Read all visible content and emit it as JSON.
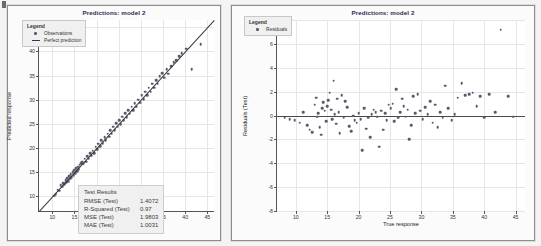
{
  "page": {
    "background_color": "#f4f4f4",
    "marker_color": "#5a5a6e",
    "line_color": "#3a3a3a"
  },
  "left_panel": {
    "legend": {
      "title": "Legend",
      "entries": [
        {
          "label": "Observations",
          "symbol": "dot"
        },
        {
          "label": "Perfect prediction",
          "symbol": "line"
        }
      ]
    },
    "results": {
      "title": "Test Results",
      "rows": [
        {
          "key": "RMSE (Test)",
          "value": "1.4072"
        },
        {
          "key": "R-Squared (Test)",
          "value": "0.97"
        },
        {
          "key": "MSE (Test)",
          "value": "1.9803"
        },
        {
          "key": "MAE (Test)",
          "value": "1.0031"
        }
      ]
    }
  },
  "right_panel": {
    "legend": {
      "title": "Legend",
      "entries": [
        {
          "label": "Residuals",
          "symbol": "dot"
        }
      ]
    }
  },
  "chart_data": [
    {
      "type": "scatter",
      "title": "Predictions: model 2",
      "xlabel": "True response",
      "ylabel": "Predicted response",
      "xlim": [
        7,
        46.5
      ],
      "ylim": [
        7,
        46.5
      ],
      "xticks": [
        10,
        15,
        20,
        25,
        30,
        35,
        40,
        45
      ],
      "yticks": [
        10,
        15,
        20,
        25,
        30,
        35,
        40,
        45
      ],
      "grid": true,
      "legend_position": "top-left",
      "series": [
        {
          "name": "Observations",
          "marker": "dot",
          "x": [
            10.4,
            10.8,
            11.2,
            11.5,
            11.9,
            12.2,
            12.4,
            12.7,
            13.0,
            13.2,
            13.4,
            13.6,
            13.8,
            14.0,
            14.2,
            14.4,
            14.6,
            14.8,
            15.0,
            15.2,
            15.4,
            15.6,
            15.8,
            16.0,
            16.2,
            16.5,
            16.8,
            17.0,
            17.3,
            17.6,
            17.9,
            18.2,
            18.5,
            18.8,
            19.1,
            19.4,
            19.8,
            20.1,
            20.4,
            20.8,
            21.1,
            21.4,
            21.8,
            22.1,
            22.5,
            22.8,
            23.1,
            23.4,
            23.8,
            24.1,
            24.4,
            24.8,
            25.1,
            25.4,
            25.8,
            26.1,
            26.5,
            26.8,
            27.2,
            27.5,
            27.9,
            28.2,
            28.6,
            29.0,
            29.4,
            29.8,
            30.2,
            30.6,
            31.0,
            31.4,
            31.8,
            32.2,
            32.6,
            33.0,
            33.4,
            33.8,
            34.2,
            34.8,
            35.2,
            35.8,
            36.2,
            36.8,
            37.4,
            38.0,
            38.6,
            39.2,
            40.2,
            41.5,
            43.5
          ],
          "y": [
            10.2,
            10.5,
            11.4,
            11.2,
            12.3,
            12.0,
            12.8,
            12.5,
            13.4,
            13.0,
            13.8,
            13.2,
            14.2,
            13.7,
            14.6,
            14.0,
            15.0,
            14.4,
            15.4,
            14.8,
            15.8,
            15.2,
            16.2,
            15.6,
            16.6,
            16.9,
            17.2,
            16.8,
            17.8,
            17.2,
            18.3,
            17.8,
            19.0,
            18.4,
            19.5,
            19.0,
            20.3,
            19.8,
            20.9,
            20.4,
            21.6,
            21.0,
            22.3,
            21.7,
            23.0,
            22.4,
            23.7,
            23.0,
            24.4,
            23.7,
            25.1,
            24.4,
            25.8,
            25.0,
            26.5,
            25.8,
            27.2,
            26.4,
            27.9,
            27.1,
            28.6,
            27.8,
            29.3,
            28.6,
            30.0,
            29.4,
            30.9,
            30.1,
            31.7,
            30.9,
            32.5,
            31.7,
            33.3,
            32.5,
            34.1,
            33.3,
            34.9,
            35.5,
            34.6,
            36.3,
            35.4,
            37.0,
            37.8,
            38.2,
            39.0,
            39.6,
            40.6,
            36.3,
            41.5
          ]
        },
        {
          "name": "Perfect prediction",
          "type": "line",
          "x": [
            7,
            46.5
          ],
          "y": [
            7,
            46.5
          ]
        }
      ]
    },
    {
      "type": "scatter",
      "title": "Predictions: model 2",
      "xlabel": "True response",
      "ylabel": "Residuals (Test)",
      "xlim": [
        7,
        46.5
      ],
      "ylim": [
        -8,
        8
      ],
      "xticks": [
        10,
        15,
        20,
        25,
        30,
        35,
        40,
        45
      ],
      "yticks": [
        -8,
        -6,
        -4,
        -2,
        0,
        2,
        4,
        6,
        8
      ],
      "grid": true,
      "legend_position": "top-left",
      "reference_line_y": 0,
      "series": [
        {
          "name": "Residuals",
          "marker": "dot",
          "x": [
            8.2,
            9.0,
            9.8,
            10.6,
            11.2,
            11.8,
            12.2,
            12.6,
            13.0,
            13.2,
            13.4,
            13.6,
            13.8,
            14.0,
            14.2,
            14.4,
            14.6,
            14.8,
            15.0,
            15.2,
            15.4,
            15.6,
            15.8,
            16.0,
            16.2,
            16.4,
            16.6,
            16.8,
            17.0,
            17.3,
            17.6,
            17.9,
            18.2,
            18.5,
            18.8,
            19.1,
            19.4,
            19.7,
            20.0,
            20.3,
            20.6,
            20.9,
            21.2,
            21.5,
            21.8,
            22.1,
            22.4,
            22.7,
            23.0,
            23.3,
            23.6,
            23.9,
            24.2,
            24.5,
            24.8,
            25.1,
            25.4,
            25.7,
            26.0,
            26.3,
            26.6,
            26.9,
            27.2,
            27.5,
            27.8,
            28.1,
            28.4,
            28.7,
            29.0,
            29.4,
            29.8,
            30.2,
            30.6,
            31.0,
            31.4,
            31.8,
            32.2,
            32.6,
            33.0,
            33.4,
            33.8,
            34.3,
            34.8,
            35.3,
            35.8,
            36.4,
            37.0,
            37.6,
            38.2,
            38.8,
            39.4,
            40.0,
            40.8,
            41.8,
            42.6,
            43.8,
            44.6
          ],
          "y": [
            -0.2,
            -0.3,
            -0.4,
            -0.6,
            0.3,
            -0.8,
            -1.2,
            -1.4,
            0.9,
            1.5,
            -0.1,
            0.2,
            -1.0,
            -1.6,
            0.6,
            1.1,
            0.4,
            -0.5,
            0.8,
            1.3,
            1.9,
            0.5,
            -0.3,
            2.9,
            0.1,
            -0.7,
            1.4,
            0.3,
            -1.5,
            1.7,
            -0.2,
            1.2,
            0.7,
            -0.9,
            -1.3,
            0.0,
            -0.4,
            -0.6,
            0.2,
            -0.3,
            -2.9,
            0.6,
            -1.1,
            -0.2,
            -1.8,
            0.1,
            0.5,
            0.3,
            -0.1,
            -2.6,
            0.4,
            -1.2,
            0.2,
            -0.4,
            0.9,
            0.6,
            1.0,
            -0.5,
            2.2,
            -0.2,
            0.3,
            1.4,
            0.8,
            -0.1,
            0.5,
            -2.0,
            -0.8,
            1.6,
            0.2,
            1.8,
            0.4,
            -0.3,
            0.7,
            0.1,
            1.2,
            -0.6,
            0.9,
            -1.0,
            0.3,
            -0.2,
            2.5,
            0.6,
            -0.4,
            0.1,
            1.5,
            2.7,
            1.7,
            1.8,
            1.9,
            0.8,
            1.6,
            -0.2,
            1.8,
            0.3,
            7.2,
            1.6,
            -0.1
          ]
        }
      ]
    }
  ]
}
